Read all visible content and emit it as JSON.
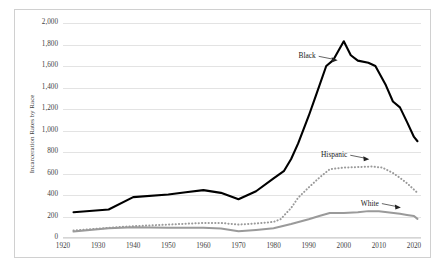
{
  "chart_data": {
    "type": "line",
    "title": "",
    "xlabel": "",
    "ylabel": "Incarceration Rates by Race",
    "xlim": [
      1920,
      2022
    ],
    "ylim": [
      0,
      2000
    ],
    "grid": true,
    "legend_position": "inline-annotations",
    "x_ticks": [
      "1920",
      "1930",
      "1940",
      "1950",
      "1960",
      "1970",
      "1980",
      "1990",
      "2000",
      "2010",
      "2020"
    ],
    "y_ticks": [
      "0",
      "200",
      "400",
      "600",
      "800",
      "1,000",
      "1,200",
      "1,400",
      "1,600",
      "1,800",
      "2,000"
    ],
    "series": [
      {
        "name": "Black",
        "color": "#000000",
        "style": "solid",
        "width": 2.1,
        "label_x": 1992,
        "label_y": 1690,
        "points": [
          [
            1923,
            240
          ],
          [
            1933,
            265
          ],
          [
            1940,
            380
          ],
          [
            1950,
            405
          ],
          [
            1955,
            425
          ],
          [
            1960,
            445
          ],
          [
            1965,
            420
          ],
          [
            1970,
            360
          ],
          [
            1975,
            435
          ],
          [
            1980,
            555
          ],
          [
            1983,
            625
          ],
          [
            1985,
            735
          ],
          [
            1987,
            880
          ],
          [
            1990,
            1135
          ],
          [
            1992,
            1320
          ],
          [
            1995,
            1600
          ],
          [
            1997,
            1655
          ],
          [
            2000,
            1830
          ],
          [
            2002,
            1700
          ],
          [
            2004,
            1650
          ],
          [
            2007,
            1630
          ],
          [
            2009,
            1600
          ],
          [
            2012,
            1420
          ],
          [
            2014,
            1270
          ],
          [
            2016,
            1215
          ],
          [
            2018,
            1080
          ],
          [
            2020,
            940
          ],
          [
            2021,
            900
          ]
        ]
      },
      {
        "name": "Hispanic",
        "color": "#9a9a9a",
        "style": "dotted",
        "width": 2.0,
        "label_x": 2001,
        "label_y": 770,
        "points": [
          [
            1923,
            70
          ],
          [
            1933,
            95
          ],
          [
            1940,
            110
          ],
          [
            1950,
            125
          ],
          [
            1960,
            140
          ],
          [
            1965,
            140
          ],
          [
            1970,
            125
          ],
          [
            1975,
            135
          ],
          [
            1980,
            150
          ],
          [
            1982,
            175
          ],
          [
            1985,
            280
          ],
          [
            1987,
            375
          ],
          [
            1990,
            470
          ],
          [
            1993,
            560
          ],
          [
            1996,
            640
          ],
          [
            2000,
            655
          ],
          [
            2004,
            660
          ],
          [
            2008,
            665
          ],
          [
            2011,
            655
          ],
          [
            2014,
            605
          ],
          [
            2016,
            560
          ],
          [
            2018,
            510
          ],
          [
            2020,
            450
          ],
          [
            2021,
            420
          ]
        ]
      },
      {
        "name": "White",
        "color": "#9a9a9a",
        "style": "solid",
        "width": 2.0,
        "label_x": 2010,
        "label_y": 320,
        "points": [
          [
            1923,
            60
          ],
          [
            1933,
            90
          ],
          [
            1940,
            100
          ],
          [
            1950,
            95
          ],
          [
            1960,
            95
          ],
          [
            1965,
            88
          ],
          [
            1970,
            62
          ],
          [
            1975,
            75
          ],
          [
            1980,
            90
          ],
          [
            1985,
            130
          ],
          [
            1990,
            175
          ],
          [
            1993,
            205
          ],
          [
            1996,
            232
          ],
          [
            2000,
            232
          ],
          [
            2004,
            240
          ],
          [
            2007,
            250
          ],
          [
            2010,
            248
          ],
          [
            2013,
            238
          ],
          [
            2016,
            225
          ],
          [
            2018,
            215
          ],
          [
            2020,
            205
          ],
          [
            2021,
            178
          ]
        ]
      }
    ]
  }
}
